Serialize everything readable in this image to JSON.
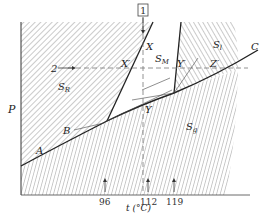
{
  "diagram": {
    "axes": {
      "y_label": "P",
      "x_label": "t (°C)",
      "x_ticks": [
        "96",
        "112",
        "119"
      ]
    },
    "regions": {
      "rhombic": "S_R",
      "rhombic_main": "S",
      "rhombic_sub": "R",
      "monoclinic_main": "S",
      "monoclinic_sub": "M",
      "liquid_main": "S",
      "liquid_sub": "l",
      "gas_main": "S",
      "gas_sub": "g"
    },
    "curve_points": {
      "A": "A",
      "B": "B",
      "C": "C",
      "X": "X",
      "X_prime": "X′",
      "Y": "Y",
      "Y_prime": "Y′",
      "Z_prime": "Z′"
    },
    "paths": {
      "path1_label": "1",
      "path2_label": "2"
    },
    "colors": {
      "line": "#222222",
      "hatch": "#555555",
      "dashed": "#777777",
      "background": "#ffffff"
    }
  }
}
